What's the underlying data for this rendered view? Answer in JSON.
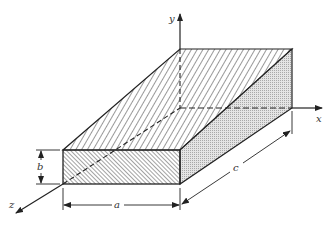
{
  "diagram": {
    "axes": {
      "x_label": "x",
      "y_label": "y",
      "z_label": "z"
    },
    "dimensions": {
      "width_label": "a",
      "height_label": "b",
      "depth_label": "c"
    },
    "colors": {
      "line": "#222222",
      "hatch": "#333333",
      "stipple": "#bdbdbd"
    }
  }
}
